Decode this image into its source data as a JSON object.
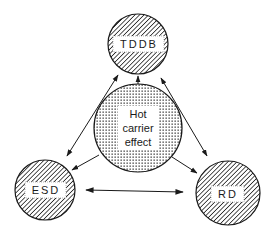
{
  "diagram": {
    "type": "relationship-diagram",
    "center_node": {
      "id": "hot-carrier",
      "label_lines": [
        "Hot",
        "carrier",
        "effect"
      ],
      "fill": "stippled"
    },
    "nodes": [
      {
        "id": "tddb",
        "label": "TDDB",
        "fill": "hatched"
      },
      {
        "id": "esd",
        "label": "ESD",
        "fill": "hatched"
      },
      {
        "id": "rd",
        "label": "RD",
        "fill": "hatched"
      }
    ],
    "edges": [
      {
        "from": "hot-carrier",
        "to": "tddb",
        "direction": "one-way"
      },
      {
        "from": "hot-carrier",
        "to": "esd",
        "direction": "one-way"
      },
      {
        "from": "hot-carrier",
        "to": "rd",
        "direction": "one-way"
      },
      {
        "from": "tddb",
        "to": "esd",
        "direction": "two-way"
      },
      {
        "from": "tddb",
        "to": "rd",
        "direction": "two-way"
      },
      {
        "from": "esd",
        "to": "rd",
        "direction": "two-way"
      }
    ],
    "colors": {
      "ink": "#1a1a1a",
      "background": "#ffffff"
    }
  }
}
